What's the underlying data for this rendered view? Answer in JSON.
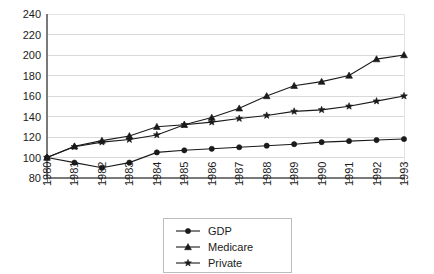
{
  "chart_data": {
    "type": "line",
    "title": "",
    "subtitle": "",
    "xlabel": "",
    "ylabel": "",
    "grid": true,
    "legend_position": "bottom",
    "xlim": [
      1980,
      1993
    ],
    "ylim": [
      80,
      240
    ],
    "ytick_step": 20,
    "yticks": [
      80,
      100,
      120,
      140,
      160,
      180,
      200,
      220,
      240
    ],
    "ytick_labels": [
      "80",
      "100",
      "120",
      "140",
      "160",
      "180",
      "200",
      "220",
      "240"
    ],
    "categories": [
      1980,
      1981,
      1982,
      1983,
      1984,
      1985,
      1986,
      1987,
      1988,
      1989,
      1990,
      1991,
      1992,
      1993
    ],
    "xtick_labels": [
      "1980",
      "1981",
      "1982",
      "1983",
      "1984",
      "1985",
      "1986",
      "1987",
      "1988",
      "1989",
      "1990",
      "1991",
      "1992",
      "1993"
    ],
    "series": [
      {
        "name": "GDP",
        "marker": "circle",
        "color": "#1a1a1a",
        "values": [
          100,
          95,
          90,
          95,
          105,
          107,
          108.5,
          110,
          111.5,
          113,
          115,
          116,
          117,
          118
        ]
      },
      {
        "name": "Medicare",
        "marker": "triangle",
        "color": "#1a1a1a",
        "values": [
          100,
          111,
          116.5,
          121,
          130,
          132,
          139,
          148,
          160,
          170,
          174,
          180,
          196,
          200
        ]
      },
      {
        "name": "Private",
        "marker": "star",
        "color": "#1a1a1a",
        "values": [
          100,
          110.5,
          115,
          117.5,
          122,
          132,
          134.5,
          138,
          141,
          145,
          146.5,
          150,
          155,
          160
        ]
      }
    ],
    "legend": [
      {
        "label": "GDP",
        "marker": "circle"
      },
      {
        "label": "Medicare",
        "marker": "triangle"
      },
      {
        "label": "Private",
        "marker": "star"
      }
    ]
  },
  "colors": {
    "background": "#ffffff",
    "ink": "#1a1a1a",
    "grid": "#d9d9d9",
    "axis": "#7a7a7a",
    "legend_border": "#bdbdbd"
  }
}
